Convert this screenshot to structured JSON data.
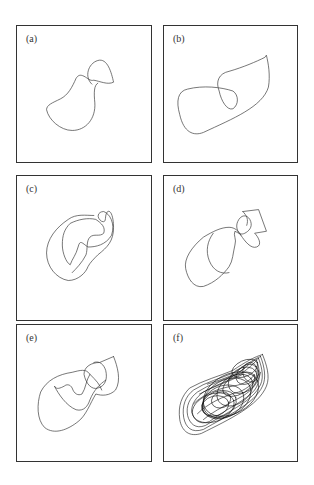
{
  "figure": {
    "panels": [
      {
        "id": "a",
        "label": "(a)",
        "description": "period-1 limit cycle with small lobe"
      },
      {
        "id": "b",
        "label": "(b)",
        "description": "period-2 limit cycle"
      },
      {
        "id": "c",
        "label": "(c)",
        "description": "period-4 orbit"
      },
      {
        "id": "d",
        "label": "(d)",
        "description": "period-4 orbit variant"
      },
      {
        "id": "e",
        "label": "(e)",
        "description": "higher-period orbit"
      },
      {
        "id": "f",
        "label": "(f)",
        "description": "chaotic attractor"
      }
    ],
    "stroke_color": "#3a3a3a",
    "frame_color": "#333333"
  }
}
